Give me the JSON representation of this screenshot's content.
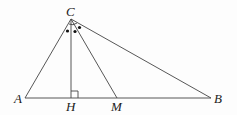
{
  "diagram": {
    "type": "triangle-geometry",
    "points": {
      "C": {
        "label": "C",
        "x": 71,
        "y": 19
      },
      "A": {
        "label": "A",
        "x": 25,
        "y": 98
      },
      "H": {
        "label": "H",
        "x": 71,
        "y": 98
      },
      "M": {
        "label": "M",
        "x": 117,
        "y": 98
      },
      "B": {
        "label": "B",
        "x": 211,
        "y": 98
      }
    },
    "segments": [
      "CA",
      "CB",
      "AB",
      "CH",
      "CM"
    ],
    "marks": {
      "right_angle_at": "H",
      "equal_angle_dots": 3
    }
  }
}
